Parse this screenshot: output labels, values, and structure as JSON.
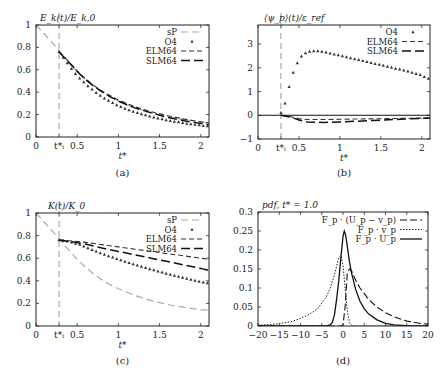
{
  "figure": {
    "panels": [
      "a",
      "b",
      "c",
      "d"
    ]
  },
  "chart_data": [
    {
      "id": "a",
      "type": "line",
      "title": "E_k(t)/E_k,0",
      "caption": "(a)",
      "xlabel": "t*",
      "ylabel": "",
      "xlim": [
        0,
        2.1
      ],
      "ylim": [
        0,
        1
      ],
      "xticks": [
        {
          "v": 0,
          "t": "0"
        },
        {
          "v": 0.28,
          "t": "t*ᵢ"
        },
        {
          "v": 0.5,
          "t": "0.5"
        },
        {
          "v": 1,
          "t": "1"
        },
        {
          "v": 1.5,
          "t": "1.5"
        },
        {
          "v": 2,
          "t": "2"
        }
      ],
      "yticks": [
        {
          "v": 0,
          "t": "0"
        },
        {
          "v": 0.2,
          "t": "0.2"
        },
        {
          "v": 0.4,
          "t": "0.4"
        },
        {
          "v": 0.6,
          "t": "0.6"
        },
        {
          "v": 0.8,
          "t": "0.8"
        },
        {
          "v": 1,
          "t": "1"
        }
      ],
      "vline": 0.28,
      "legend_position": "upper right",
      "series": [
        {
          "name": "sP",
          "style": "sp",
          "x": [
            0,
            0.1,
            0.2,
            0.28,
            0.4,
            0.5,
            0.6,
            0.7,
            0.8,
            0.9,
            1.0,
            1.2,
            1.4,
            1.6,
            1.8,
            2.0,
            2.1
          ],
          "y": [
            1.0,
            0.92,
            0.84,
            0.77,
            0.67,
            0.58,
            0.51,
            0.45,
            0.4,
            0.355,
            0.32,
            0.26,
            0.215,
            0.18,
            0.155,
            0.135,
            0.125
          ]
        },
        {
          "name": "O4",
          "style": "markers",
          "x": [
            0.28,
            0.33,
            0.38,
            0.43,
            0.48,
            0.53,
            0.58,
            0.63,
            0.68,
            0.73,
            0.78,
            0.83,
            0.88,
            0.93,
            0.98,
            1.03,
            1.08,
            1.13,
            1.18,
            1.23,
            1.28,
            1.33,
            1.38,
            1.43,
            1.48,
            1.53,
            1.58,
            1.63,
            1.68,
            1.73,
            1.78,
            1.83,
            1.88,
            1.93,
            1.98,
            2.03,
            2.08
          ],
          "y": [
            0.76,
            0.71,
            0.66,
            0.61,
            0.565,
            0.525,
            0.49,
            0.455,
            0.425,
            0.395,
            0.37,
            0.345,
            0.325,
            0.305,
            0.285,
            0.27,
            0.255,
            0.24,
            0.228,
            0.216,
            0.205,
            0.195,
            0.185,
            0.176,
            0.168,
            0.16,
            0.152,
            0.145,
            0.139,
            0.133,
            0.127,
            0.121,
            0.116,
            0.111,
            0.106,
            0.101,
            0.097
          ]
        },
        {
          "name": "ELM64",
          "style": "elm",
          "x": [
            0.28,
            0.4,
            0.5,
            0.6,
            0.7,
            0.8,
            0.9,
            1.0,
            1.2,
            1.4,
            1.6,
            1.8,
            2.0,
            2.1
          ],
          "y": [
            0.76,
            0.67,
            0.59,
            0.52,
            0.46,
            0.41,
            0.37,
            0.33,
            0.27,
            0.225,
            0.19,
            0.16,
            0.135,
            0.125
          ]
        },
        {
          "name": "SLM64",
          "style": "slm",
          "x": [
            0.28,
            0.4,
            0.5,
            0.6,
            0.7,
            0.8,
            0.9,
            1.0,
            1.2,
            1.4,
            1.6,
            1.8,
            2.0,
            2.1
          ],
          "y": [
            0.76,
            0.665,
            0.585,
            0.515,
            0.455,
            0.405,
            0.36,
            0.32,
            0.26,
            0.215,
            0.175,
            0.145,
            0.12,
            0.11
          ]
        }
      ]
    },
    {
      "id": "b",
      "type": "line",
      "title": "⟨ψ_p⟩(t)/ε_ref",
      "caption": "(b)",
      "xlabel": "t*",
      "ylabel": "",
      "xlim": [
        0,
        2.1
      ],
      "ylim": [
        -1,
        3.8
      ],
      "xticks": [
        {
          "v": 0,
          "t": "0"
        },
        {
          "v": 0.28,
          "t": "t*ᵢ"
        },
        {
          "v": 0.5,
          "t": "0.5"
        },
        {
          "v": 1,
          "t": "1"
        },
        {
          "v": 1.5,
          "t": "1.5"
        },
        {
          "v": 2,
          "t": "2"
        }
      ],
      "yticks": [
        {
          "v": -1,
          "t": "−1"
        },
        {
          "v": 0,
          "t": "0"
        },
        {
          "v": 1,
          "t": "1"
        },
        {
          "v": 2,
          "t": "2"
        },
        {
          "v": 3,
          "t": "3"
        }
      ],
      "vline": 0.28,
      "hline": 0,
      "legend_position": "upper right",
      "series": [
        {
          "name": "O4",
          "style": "markers",
          "x": [
            0.28,
            0.33,
            0.38,
            0.43,
            0.48,
            0.53,
            0.58,
            0.63,
            0.68,
            0.73,
            0.78,
            0.83,
            0.88,
            0.93,
            0.98,
            1.03,
            1.08,
            1.13,
            1.18,
            1.23,
            1.28,
            1.33,
            1.38,
            1.43,
            1.48,
            1.53,
            1.58,
            1.63,
            1.68,
            1.73,
            1.78,
            1.83,
            1.88,
            1.93,
            1.98,
            2.03,
            2.08
          ],
          "y": [
            0.1,
            0.5,
            1.2,
            1.8,
            2.2,
            2.48,
            2.62,
            2.68,
            2.7,
            2.7,
            2.68,
            2.65,
            2.61,
            2.57,
            2.53,
            2.49,
            2.45,
            2.41,
            2.37,
            2.33,
            2.29,
            2.25,
            2.21,
            2.17,
            2.13,
            2.09,
            2.05,
            2.01,
            1.97,
            1.93,
            1.89,
            1.85,
            1.8,
            1.75,
            1.7,
            1.62,
            1.55
          ]
        },
        {
          "name": "ELM64",
          "style": "elm",
          "x": [
            0.28,
            0.4,
            0.5,
            0.6,
            0.8,
            1.0,
            1.2,
            1.4,
            1.6,
            1.8,
            2.0,
            2.1
          ],
          "y": [
            0.0,
            -0.06,
            -0.14,
            -0.18,
            -0.18,
            -0.17,
            -0.16,
            -0.15,
            -0.14,
            -0.13,
            -0.12,
            -0.12
          ]
        },
        {
          "name": "SLM64",
          "style": "slm",
          "x": [
            0.28,
            0.4,
            0.5,
            0.6,
            0.8,
            1.0,
            1.2,
            1.4,
            1.6,
            1.8,
            2.0,
            2.1
          ],
          "y": [
            0.0,
            -0.08,
            -0.2,
            -0.28,
            -0.3,
            -0.28,
            -0.25,
            -0.22,
            -0.19,
            -0.16,
            -0.13,
            -0.12
          ]
        }
      ]
    },
    {
      "id": "c",
      "type": "line",
      "title": "K(t)/K_0",
      "caption": "(c)",
      "xlabel": "t*",
      "ylabel": "",
      "xlim": [
        0,
        2.1
      ],
      "ylim": [
        0,
        1
      ],
      "xticks": [
        {
          "v": 0,
          "t": "0"
        },
        {
          "v": 0.28,
          "t": "t*ᵢ"
        },
        {
          "v": 0.5,
          "t": "0.5"
        },
        {
          "v": 1,
          "t": "1"
        },
        {
          "v": 1.5,
          "t": "1.5"
        },
        {
          "v": 2,
          "t": "2"
        }
      ],
      "yticks": [
        {
          "v": 0,
          "t": "0"
        },
        {
          "v": 0.2,
          "t": "0.2"
        },
        {
          "v": 0.4,
          "t": "0.4"
        },
        {
          "v": 0.6,
          "t": "0.6"
        },
        {
          "v": 0.8,
          "t": "0.8"
        },
        {
          "v": 1,
          "t": "1"
        }
      ],
      "vline": 0.28,
      "legend_position": "upper right",
      "series": [
        {
          "name": "sP",
          "style": "sp",
          "x": [
            0,
            0.1,
            0.2,
            0.28,
            0.4,
            0.5,
            0.6,
            0.7,
            0.8,
            0.9,
            1.0,
            1.2,
            1.4,
            1.6,
            1.8,
            2.0,
            2.1
          ],
          "y": [
            1.0,
            0.92,
            0.84,
            0.77,
            0.67,
            0.59,
            0.52,
            0.46,
            0.41,
            0.365,
            0.33,
            0.27,
            0.225,
            0.19,
            0.165,
            0.145,
            0.14
          ]
        },
        {
          "name": "O4",
          "style": "markers",
          "x": [
            0.28,
            0.33,
            0.38,
            0.43,
            0.48,
            0.53,
            0.58,
            0.63,
            0.68,
            0.73,
            0.78,
            0.83,
            0.88,
            0.93,
            0.98,
            1.03,
            1.08,
            1.13,
            1.18,
            1.23,
            1.28,
            1.33,
            1.38,
            1.43,
            1.48,
            1.53,
            1.58,
            1.63,
            1.68,
            1.73,
            1.78,
            1.83,
            1.88,
            1.93,
            1.98,
            2.03,
            2.08
          ],
          "y": [
            0.76,
            0.755,
            0.75,
            0.74,
            0.73,
            0.72,
            0.705,
            0.69,
            0.675,
            0.66,
            0.645,
            0.632,
            0.62,
            0.607,
            0.595,
            0.583,
            0.571,
            0.56,
            0.549,
            0.538,
            0.527,
            0.516,
            0.505,
            0.495,
            0.485,
            0.475,
            0.465,
            0.455,
            0.446,
            0.437,
            0.428,
            0.419,
            0.41,
            0.402,
            0.394,
            0.386,
            0.38
          ]
        },
        {
          "name": "ELM64",
          "style": "elm",
          "x": [
            0.28,
            0.4,
            0.6,
            0.8,
            1.0,
            1.2,
            1.4,
            1.6,
            1.8,
            2.0,
            2.1
          ],
          "y": [
            0.76,
            0.755,
            0.74,
            0.72,
            0.7,
            0.68,
            0.66,
            0.64,
            0.62,
            0.6,
            0.59
          ]
        },
        {
          "name": "SLM64",
          "style": "slm",
          "x": [
            0.28,
            0.4,
            0.6,
            0.8,
            1.0,
            1.2,
            1.4,
            1.6,
            1.8,
            2.0,
            2.1
          ],
          "y": [
            0.76,
            0.75,
            0.725,
            0.69,
            0.66,
            0.63,
            0.6,
            0.57,
            0.54,
            0.51,
            0.49
          ]
        }
      ]
    },
    {
      "id": "d",
      "type": "line",
      "title": "pdf, t* = 1.0",
      "caption": "(d)",
      "xlabel": "",
      "ylabel": "",
      "xlim": [
        -20,
        20
      ],
      "ylim": [
        0,
        0.3
      ],
      "xticks": [
        {
          "v": -20,
          "t": "−20"
        },
        {
          "v": -15,
          "t": "−15"
        },
        {
          "v": -10,
          "t": "−10"
        },
        {
          "v": -5,
          "t": "−5"
        },
        {
          "v": 0,
          "t": "0"
        },
        {
          "v": 5,
          "t": "5"
        },
        {
          "v": 10,
          "t": "10"
        },
        {
          "v": 15,
          "t": "15"
        },
        {
          "v": 20,
          "t": "20"
        }
      ],
      "yticks": [
        {
          "v": 0,
          "t": "0"
        },
        {
          "v": 0.05,
          "t": "0.05"
        },
        {
          "v": 0.1,
          "t": "0.1"
        },
        {
          "v": 0.15,
          "t": "0.15"
        },
        {
          "v": 0.2,
          "t": "0.2"
        },
        {
          "v": 0.25,
          "t": "0.25"
        },
        {
          "v": 0.3,
          "t": "0.3"
        }
      ],
      "legend_position": "upper right",
      "series": [
        {
          "name": "F_p · (U_p − v_p)",
          "style": "longdash",
          "x": [
            -20,
            -2,
            -0.5,
            0,
            0.5,
            1,
            1.5,
            2,
            3,
            4,
            5,
            6,
            8,
            10,
            12,
            15,
            18,
            20
          ],
          "y": [
            0,
            0,
            0,
            0.002,
            0.05,
            0.14,
            0.15,
            0.145,
            0.12,
            0.1,
            0.085,
            0.07,
            0.05,
            0.035,
            0.024,
            0.013,
            0.007,
            0.005
          ]
        },
        {
          "name": "F_p · v_p",
          "style": "dotted",
          "x": [
            -20,
            -17,
            -15,
            -12,
            -10,
            -8,
            -6,
            -4,
            -3,
            -2,
            -1,
            -0.5,
            0,
            0.5,
            1,
            1.5,
            2,
            3,
            5,
            20
          ],
          "y": [
            0.002,
            0.004,
            0.006,
            0.012,
            0.02,
            0.03,
            0.045,
            0.075,
            0.1,
            0.135,
            0.18,
            0.185,
            0.16,
            0.1,
            0.04,
            0.01,
            0.002,
            0,
            0,
            0
          ]
        },
        {
          "name": "F_p · U_p",
          "style": "solid",
          "x": [
            -20,
            -4,
            -3,
            -2.5,
            -2,
            -1.5,
            -1,
            -0.5,
            0,
            0.3,
            0.6,
            1,
            1.5,
            2,
            3,
            4,
            5,
            6,
            8,
            10,
            12,
            15,
            20
          ],
          "y": [
            0,
            0,
            0.003,
            0.01,
            0.03,
            0.07,
            0.12,
            0.18,
            0.235,
            0.25,
            0.24,
            0.21,
            0.17,
            0.14,
            0.095,
            0.065,
            0.045,
            0.032,
            0.016,
            0.007,
            0.003,
            0.001,
            0
          ]
        }
      ]
    }
  ]
}
